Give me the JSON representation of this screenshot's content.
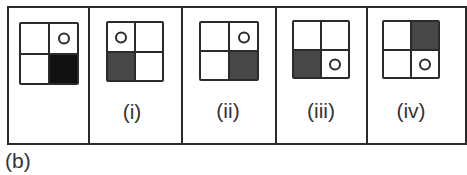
{
  "figure": {
    "caption": "(b)",
    "panels": [
      {
        "id": "question",
        "label": "",
        "filled_cell": "bottom-right",
        "fill_color": "#111111",
        "circle_cell": "top-right"
      },
      {
        "id": "option-i",
        "label": "(i)",
        "filled_cell": "bottom-left",
        "fill_color": "#474747",
        "circle_cell": "top-left"
      },
      {
        "id": "option-ii",
        "label": "(ii)",
        "filled_cell": "bottom-right",
        "fill_color": "#474747",
        "circle_cell": "top-right"
      },
      {
        "id": "option-iii",
        "label": "(iii)",
        "filled_cell": "bottom-left",
        "fill_color": "#474747",
        "circle_cell": "bottom-right"
      },
      {
        "id": "option-iv",
        "label": "(iv)",
        "filled_cell": "top-right",
        "fill_color": "#474747",
        "circle_cell": "bottom-right"
      }
    ]
  }
}
